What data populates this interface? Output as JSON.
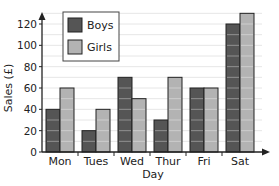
{
  "chart_data": {
    "type": "bar",
    "title": "",
    "xlabel": "Day",
    "ylabel": "Sales (£)",
    "categories": [
      "Mon",
      "Tues",
      "Wed",
      "Thur",
      "Fri",
      "Sat"
    ],
    "series": [
      {
        "name": "Boys",
        "values": [
          40,
          20,
          70,
          30,
          60,
          120
        ],
        "color": "#555555"
      },
      {
        "name": "Girls",
        "values": [
          60,
          40,
          50,
          70,
          60,
          130
        ],
        "color": "#b3b3b3"
      }
    ],
    "yticks": [
      0,
      20,
      40,
      60,
      80,
      100,
      120
    ],
    "ylim": [
      0,
      140
    ],
    "grid": true,
    "legend_position": "upper-left"
  },
  "legend": {
    "boys_label": "Boys",
    "girls_label": "Girls"
  },
  "axes": {
    "xlabel": "Day",
    "ylabel": "Sales (£)"
  }
}
